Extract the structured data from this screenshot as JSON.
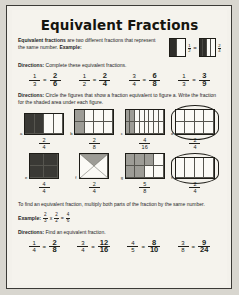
{
  "worksheet": {
    "title": "Equivalent Fractions",
    "intro": {
      "bold_lead": "Equivalent fractions",
      "body": " are two different fractions that represent the same number. ",
      "bold_example": "Example:"
    },
    "directions_1": {
      "label": "Directions:",
      "text": " Complete these equivalent fractions."
    },
    "header_example": {
      "left": {
        "cols": 2,
        "shaded": 1,
        "fraction": {
          "num": "1",
          "den": "2"
        }
      },
      "equals": "=",
      "right": {
        "cols": 4,
        "shaded": 2,
        "fraction": {
          "num": "2",
          "den": "4"
        }
      }
    },
    "row1": [
      {
        "left": {
          "num": "1",
          "den": "3"
        },
        "right": {
          "num": "2",
          "den": "6"
        }
      },
      {
        "left": {
          "num": "1",
          "den": "2"
        },
        "right": {
          "num": "2",
          "den": "4"
        }
      },
      {
        "left": {
          "num": "3",
          "den": "4"
        },
        "right": {
          "num": "6",
          "den": "8"
        }
      },
      {
        "left": {
          "num": "1",
          "den": "3"
        },
        "right": {
          "num": "3",
          "den": "9"
        }
      }
    ],
    "directions_2": {
      "label": "Directions:",
      "text": " Circle the figures that show a fraction equivalent to figure a. Write the fraction for the shaded area under each figure."
    },
    "figures": [
      {
        "label": "a",
        "cols": 4,
        "rows": 1,
        "shaded": [
          1,
          1,
          0,
          0
        ],
        "shade": "dark",
        "circled": false,
        "answer": {
          "num": "2",
          "den": "4"
        }
      },
      {
        "label": "b",
        "cols": 4,
        "rows": 2,
        "shaded": [
          1,
          0,
          0,
          0,
          1,
          0,
          0,
          0
        ],
        "shade": "mid",
        "circled": false,
        "answer": {
          "num": "2",
          "den": "8"
        }
      },
      {
        "label": "c",
        "cols": 8,
        "rows": 2,
        "shaded": [
          1,
          1,
          0,
          0,
          0,
          0,
          0,
          0,
          1,
          1,
          0,
          0,
          0,
          0,
          0,
          0
        ],
        "shade": "mid",
        "circled": false,
        "answer": {
          "num": "4",
          "den": "16"
        }
      },
      {
        "label": "d",
        "cols": 4,
        "rows": 2,
        "shaded": [
          0,
          0,
          0,
          0,
          0,
          0,
          0,
          0
        ],
        "shade": "mid",
        "circled": true,
        "answer": {
          "num": "2",
          "den": "4"
        }
      },
      {
        "label": "e",
        "cols": 2,
        "rows": 2,
        "shaded": [
          1,
          1,
          1,
          1
        ],
        "shade": "dark",
        "circled": false,
        "answer": {
          "num": "4",
          "den": "4"
        }
      },
      {
        "label": "f",
        "cols": 1,
        "rows": 1,
        "shaded": [
          0
        ],
        "shade": "mid",
        "circled": false,
        "cross": true,
        "answer": {
          "num": "2",
          "den": "4"
        }
      },
      {
        "label": "g",
        "cols": 4,
        "rows": 2,
        "shaded": [
          1,
          1,
          1,
          0,
          1,
          1,
          0,
          0
        ],
        "shade": "mid",
        "circled": false,
        "answer": {
          "num": "5",
          "den": "8"
        }
      },
      {
        "label": "h",
        "cols": 4,
        "rows": 1,
        "shaded": [
          0,
          0,
          0,
          0
        ],
        "shade": "mid",
        "circled": true,
        "answer": {
          "num": "2",
          "den": "4"
        }
      }
    ],
    "note": "To find an equivalent fraction, multiply both parts of the fraction by the same number.",
    "example2": {
      "label": "Example:",
      "a": {
        "num": "2",
        "den": "3"
      },
      "times": "x",
      "b": {
        "num": "2",
        "den": "2"
      },
      "equals": "=",
      "c": {
        "num": "4",
        "den": "6"
      }
    },
    "directions_3": {
      "label": "Directions:",
      "text": " Find an equivalent fraction."
    },
    "row2": [
      {
        "left": {
          "num": "1",
          "den": "4"
        },
        "right": {
          "num": "2",
          "den": "8"
        }
      },
      {
        "left": {
          "num": "3",
          "den": "4"
        },
        "right": {
          "num": "12",
          "den": "16"
        }
      },
      {
        "left": {
          "num": "4",
          "den": "5"
        },
        "right": {
          "num": "8",
          "den": "10"
        }
      },
      {
        "left": {
          "num": "3",
          "den": "8"
        },
        "right": {
          "num": "9",
          "den": "24"
        }
      }
    ]
  }
}
